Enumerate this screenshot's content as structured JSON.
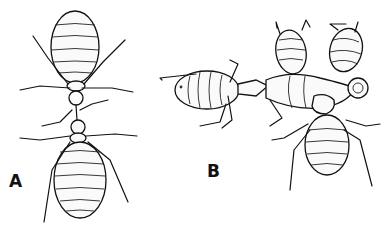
{
  "figure": {
    "panels": [
      {
        "id": "A",
        "label": "A",
        "subject": "Two worker ants meeting head-to-head (trophallaxis), dorsal view"
      },
      {
        "id": "B",
        "label": "B",
        "subject": "Ant attended by several nymphs/larvae clustered around its body"
      }
    ]
  },
  "colors": {
    "ink": "#111111",
    "paper": "#ffffff"
  }
}
